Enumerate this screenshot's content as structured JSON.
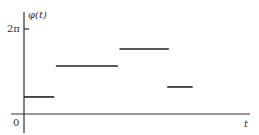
{
  "chart_data": {
    "type": "line",
    "subtype": "piecewise-constant",
    "title": "",
    "xlabel": "t",
    "ylabel": "φ(t)",
    "origin_label": "0",
    "y_ticks": [
      {
        "value": 6.2832,
        "label": "2π"
      }
    ],
    "xlim": [
      0,
      7.1
    ],
    "ylim": [
      0,
      6.2832
    ],
    "grid": false,
    "legend": "none",
    "segments": [
      {
        "x_start": 0.0,
        "x_end": 0.95,
        "y": 1.26
      },
      {
        "x_start": 1.0,
        "x_end": 2.95,
        "y": 3.55
      },
      {
        "x_start": 3.0,
        "x_end": 4.55,
        "y": 4.8
      },
      {
        "x_start": 4.5,
        "x_end": 5.3,
        "y": 2.0
      }
    ]
  }
}
